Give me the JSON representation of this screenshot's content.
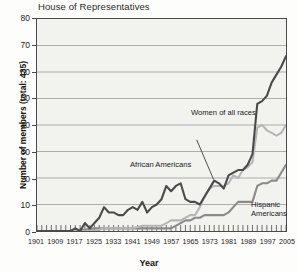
{
  "chart_title": "House of Representatives",
  "axes": {
    "ylabel": "Number of members (total: 435)",
    "xlabel": "Year",
    "yticks": [
      "0",
      "10",
      "20",
      "30",
      "40",
      "50",
      "60",
      "70",
      "80"
    ],
    "xticks": [
      "1901",
      "1909",
      "1917",
      "1925",
      "1933",
      "1941",
      "1949",
      "1957",
      "1965",
      "1973",
      "1981",
      "1989",
      "1997",
      "2005"
    ]
  },
  "annotations": {
    "women": "Women of all races",
    "african": "African Americans",
    "hispanic_line1": "Hispanic",
    "hispanic_line2": "Americans"
  },
  "colors": {
    "women": "#4a4a4a",
    "african": "#b6b6b6",
    "hispanic": "#8a8a8a",
    "plot_background": "#f2f2ef",
    "gridline": "#9a9a9a",
    "axis": "#4a4a4a"
  },
  "chart_data": {
    "type": "line",
    "title": "House of Representatives",
    "xlabel": "Year",
    "ylabel": "Number of members (total: 435)",
    "xlim": [
      1901,
      2005
    ],
    "ylim": [
      0,
      80
    ],
    "grid": true,
    "legend": "inline-annotations",
    "series": [
      {
        "name": "Women of all races",
        "color": "#4a4a4a",
        "x": [
          1901,
          1903,
          1905,
          1907,
          1909,
          1911,
          1913,
          1915,
          1917,
          1919,
          1921,
          1923,
          1925,
          1927,
          1929,
          1931,
          1933,
          1935,
          1937,
          1939,
          1941,
          1943,
          1945,
          1947,
          1949,
          1951,
          1953,
          1955,
          1957,
          1959,
          1961,
          1963,
          1965,
          1967,
          1969,
          1971,
          1973,
          1975,
          1977,
          1979,
          1981,
          1983,
          1985,
          1987,
          1989,
          1991,
          1993,
          1995,
          1997,
          1999,
          2001,
          2003,
          2005
        ],
        "values": [
          0,
          0,
          0,
          0,
          0,
          0,
          0,
          0,
          1,
          0,
          3,
          1,
          3,
          5,
          9,
          7,
          7,
          6,
          6,
          8,
          9,
          8,
          11,
          7,
          9,
          10,
          12,
          17,
          15,
          17,
          18,
          12,
          11,
          11,
          10,
          13,
          16,
          19,
          18,
          16,
          21,
          22,
          23,
          23,
          25,
          29,
          48,
          49,
          51,
          56,
          59,
          62,
          66
        ]
      },
      {
        "name": "African Americans",
        "color": "#b6b6b6",
        "x": [
          1901,
          1909,
          1917,
          1925,
          1929,
          1933,
          1937,
          1941,
          1945,
          1949,
          1953,
          1955,
          1957,
          1959,
          1961,
          1963,
          1965,
          1967,
          1969,
          1971,
          1973,
          1975,
          1977,
          1979,
          1981,
          1983,
          1985,
          1987,
          1989,
          1991,
          1993,
          1995,
          1997,
          1999,
          2001,
          2003,
          2005
        ],
        "values": [
          0,
          0,
          0,
          0,
          1,
          1,
          1,
          1,
          2,
          2,
          2,
          3,
          4,
          4,
          4,
          5,
          6,
          6,
          9,
          13,
          16,
          17,
          17,
          17,
          18,
          21,
          20,
          23,
          24,
          26,
          39,
          40,
          38,
          37,
          36,
          37,
          40
        ]
      },
      {
        "name": "Hispanic Americans",
        "color": "#8a8a8a",
        "x": [
          1901,
          1909,
          1917,
          1925,
          1933,
          1941,
          1945,
          1949,
          1953,
          1957,
          1961,
          1963,
          1965,
          1967,
          1969,
          1971,
          1973,
          1975,
          1977,
          1979,
          1981,
          1983,
          1985,
          1987,
          1989,
          1991,
          1993,
          1995,
          1997,
          1999,
          2001,
          2003,
          2005
        ],
        "values": [
          0,
          0,
          0,
          1,
          1,
          1,
          1,
          1,
          1,
          1,
          3,
          4,
          4,
          5,
          5,
          6,
          6,
          6,
          6,
          6,
          7,
          9,
          11,
          11,
          11,
          11,
          17,
          18,
          18,
          19,
          19,
          22,
          25
        ]
      }
    ]
  }
}
